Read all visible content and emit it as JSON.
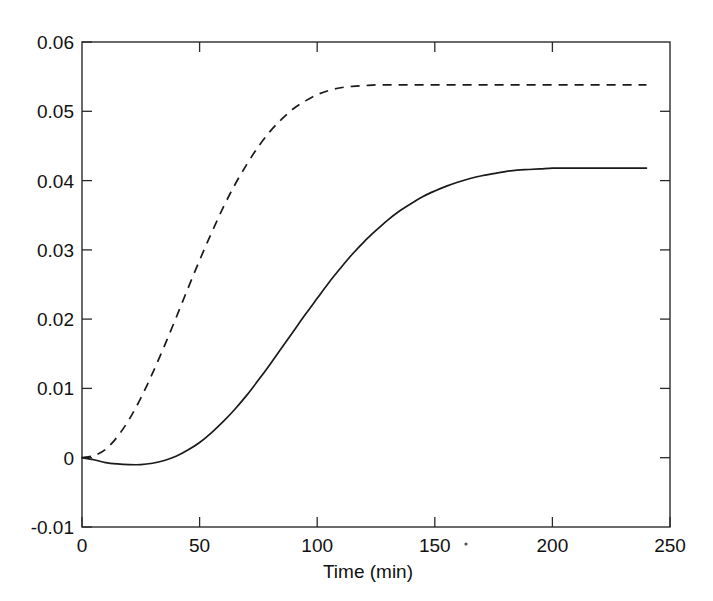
{
  "figure": {
    "background_color": "#ffffff",
    "ink_color": "#1a1a1a"
  },
  "chart_data": {
    "type": "line",
    "title": "",
    "subtitle": "",
    "xlabel": "Time (min)",
    "ylabel": "",
    "xlim": [
      0,
      250
    ],
    "ylim": [
      -0.01,
      0.06
    ],
    "xticks": [
      0,
      50,
      100,
      150,
      200,
      250
    ],
    "xtick_labels": [
      "0",
      "50",
      "100",
      "150",
      "200",
      "250"
    ],
    "yticks": [
      -0.01,
      0,
      0.01,
      0.02,
      0.03,
      0.04,
      0.05,
      0.06
    ],
    "ytick_labels": [
      "-0.01",
      "0",
      "0.01",
      "0.02",
      "0.03",
      "0.04",
      "0.05",
      "0.06"
    ],
    "grid": false,
    "legend": null,
    "legend_position": "none",
    "annotations": [],
    "x": [
      0,
      5,
      10,
      15,
      20,
      25,
      30,
      35,
      40,
      45,
      50,
      55,
      60,
      65,
      70,
      75,
      80,
      85,
      90,
      95,
      100,
      105,
      110,
      115,
      120,
      125,
      130,
      135,
      140,
      145,
      150,
      155,
      160,
      165,
      170,
      175,
      180,
      185,
      190,
      195,
      200,
      205,
      210,
      215,
      220,
      225,
      230,
      235,
      240
    ],
    "series": [
      {
        "name": "solid-curve",
        "style": "solid",
        "color": "#1a1a1a",
        "values": [
          0.0,
          -0.0003,
          -0.0007,
          -0.0009,
          -0.001,
          -0.001,
          -0.0008,
          -0.0004,
          0.0002,
          0.0011,
          0.0022,
          0.0036,
          0.0052,
          0.007,
          0.009,
          0.0112,
          0.0135,
          0.0159,
          0.0183,
          0.0207,
          0.023,
          0.0253,
          0.0274,
          0.0294,
          0.0312,
          0.0328,
          0.0343,
          0.0356,
          0.0367,
          0.0377,
          0.0385,
          0.0392,
          0.0398,
          0.0403,
          0.0407,
          0.041,
          0.0413,
          0.0415,
          0.0416,
          0.0417,
          0.0418,
          0.0418,
          0.0418,
          0.0418,
          0.0418,
          0.0418,
          0.0418,
          0.0418,
          0.0418
        ]
      },
      {
        "name": "dashed-curve",
        "style": "dashed",
        "color": "#1a1a1a",
        "values": [
          0.0,
          0.0003,
          0.0012,
          0.003,
          0.0055,
          0.0086,
          0.0122,
          0.0161,
          0.0202,
          0.0244,
          0.0285,
          0.0324,
          0.0361,
          0.0394,
          0.0423,
          0.0449,
          0.0471,
          0.0489,
          0.0504,
          0.0515,
          0.0524,
          0.053,
          0.0534,
          0.0536,
          0.0537,
          0.0538,
          0.0538,
          0.0538,
          0.0538,
          0.0538,
          0.0538,
          0.0538,
          0.0538,
          0.0538,
          0.0538,
          0.0538,
          0.0538,
          0.0538,
          0.0538,
          0.0538,
          0.0538,
          0.0538,
          0.0538,
          0.0538,
          0.0538,
          0.0538,
          0.0538,
          0.0538,
          0.0538
        ]
      }
    ],
    "notes": {
      "solid_plateau": 0.0418,
      "dashed_plateau": 0.0538,
      "solid_min": -0.001,
      "solid_min_at": 22,
      "data_x_end": 240
    }
  }
}
